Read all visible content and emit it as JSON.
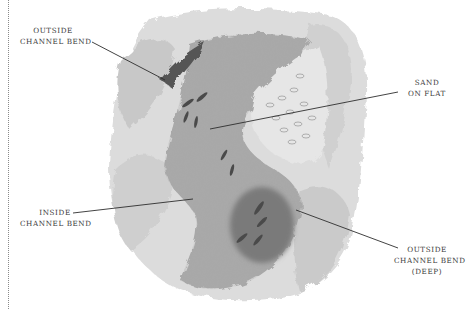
{
  "figure": {
    "palette": {
      "background": "#ffffff",
      "bank_light": "#d8d8d8",
      "bank_mid": "#b4b4b4",
      "water_mid": "#9a9a9a",
      "water_dark": "#6e6e6e",
      "ink": "#2e2e2e",
      "label_text": "#3a3a3a"
    }
  },
  "labels": {
    "outside_bend_top": {
      "line1": "OUTSIDE",
      "line2": "CHANNEL BEND"
    },
    "sand_on_flat": {
      "line1": "SAND",
      "line2": "ON FLAT"
    },
    "inside_bend": {
      "line1": "INSIDE",
      "line2": "CHANNEL BEND"
    },
    "outside_bend_deep": {
      "line1": "OUTSIDE",
      "line2": "CHANNEL BEND",
      "line3": "(DEEP)"
    }
  }
}
